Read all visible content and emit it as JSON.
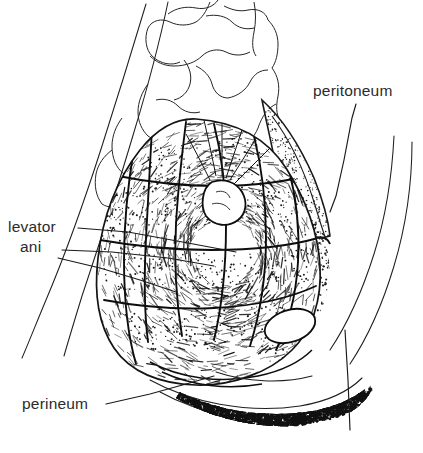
{
  "figure": {
    "type": "anatomical-line-drawing",
    "background_color": "#ffffff",
    "ink_color": "#1a1a1a",
    "label_color": "#2b2b2b",
    "width": 423,
    "height": 453
  },
  "labels": [
    {
      "id": "peritoneum",
      "text": "peritoneum",
      "x": 313,
      "y": 96,
      "anchor": "start"
    },
    {
      "id": "levator",
      "text": "levator",
      "x": 8,
      "y": 232,
      "anchor": "start"
    },
    {
      "id": "ani",
      "text": "ani",
      "x": 20,
      "y": 252,
      "anchor": "start"
    },
    {
      "id": "perineum",
      "text": "perineum",
      "x": 22,
      "y": 409,
      "anchor": "start"
    }
  ],
  "leader_lines": [
    {
      "for": "peritoneum",
      "points": "356,104 352,118 344,160 336,196 330,212"
    },
    {
      "for": "levator",
      "points": "78,228 128,232 188,243 236,252"
    },
    {
      "for": "ani",
      "points": "62,250 112,252 168,258 214,266"
    },
    {
      "for": "ani-2",
      "points": "58,258 100,268 140,280 176,292"
    },
    {
      "for": "perineum",
      "points": "106,404 150,394 186,384 214,376"
    },
    {
      "for": "fat-band",
      "points": "345,330 348,380 350,430"
    }
  ],
  "regions": [
    {
      "id": "body-contour-left",
      "name": "body outline, left",
      "texture": "outline"
    },
    {
      "id": "body-contour-right",
      "name": "body outline, right",
      "texture": "outline"
    },
    {
      "id": "sacrum-vertebrae",
      "name": "sacrum and lumbar vertebrae",
      "texture": "outline"
    },
    {
      "id": "levator-ani-muscle",
      "name": "levator ani muscle sheet",
      "texture": "hatched-and-stippled"
    },
    {
      "id": "peritoneal-fold",
      "name": "peritoneal reflection",
      "texture": "stippled"
    },
    {
      "id": "obturator-space",
      "name": "ischiorectal white oval",
      "texture": "blank"
    },
    {
      "id": "subcutaneous-fat",
      "name": "subcutaneous fat band",
      "texture": "coarse-granular"
    }
  ]
}
